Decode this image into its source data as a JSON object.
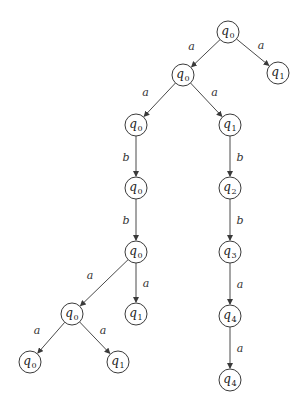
{
  "diagram": {
    "type": "tree",
    "title": "",
    "nodes": [
      {
        "id": "n0",
        "label": "q",
        "sub": "0",
        "x": 228,
        "y": 32
      },
      {
        "id": "n1",
        "label": "q",
        "sub": "0",
        "x": 183,
        "y": 75
      },
      {
        "id": "n2",
        "label": "q",
        "sub": "1",
        "x": 278,
        "y": 73
      },
      {
        "id": "n3",
        "label": "q",
        "sub": "0",
        "x": 136,
        "y": 125
      },
      {
        "id": "n4",
        "label": "q",
        "sub": "1",
        "x": 230,
        "y": 125
      },
      {
        "id": "n5",
        "label": "q",
        "sub": "0",
        "x": 136,
        "y": 188
      },
      {
        "id": "n6",
        "label": "q",
        "sub": "2",
        "x": 230,
        "y": 188
      },
      {
        "id": "n7",
        "label": "q",
        "sub": "0",
        "x": 136,
        "y": 252
      },
      {
        "id": "n8",
        "label": "q",
        "sub": "3",
        "x": 230,
        "y": 252
      },
      {
        "id": "n9",
        "label": "q",
        "sub": "0",
        "x": 72,
        "y": 314
      },
      {
        "id": "n10",
        "label": "q",
        "sub": "1",
        "x": 136,
        "y": 314
      },
      {
        "id": "n11",
        "label": "q",
        "sub": "4",
        "x": 230,
        "y": 316
      },
      {
        "id": "n12",
        "label": "q",
        "sub": "0",
        "x": 30,
        "y": 362
      },
      {
        "id": "n13",
        "label": "q",
        "sub": "1",
        "x": 118,
        "y": 362
      },
      {
        "id": "n14",
        "label": "q",
        "sub": "4",
        "x": 230,
        "y": 380
      }
    ],
    "edges": [
      {
        "from": "n0",
        "to": "n1",
        "label": "a"
      },
      {
        "from": "n0",
        "to": "n2",
        "label": "a"
      },
      {
        "from": "n1",
        "to": "n3",
        "label": "a"
      },
      {
        "from": "n1",
        "to": "n4",
        "label": "a"
      },
      {
        "from": "n3",
        "to": "n5",
        "label": "b"
      },
      {
        "from": "n4",
        "to": "n6",
        "label": "b"
      },
      {
        "from": "n5",
        "to": "n7",
        "label": "b"
      },
      {
        "from": "n6",
        "to": "n8",
        "label": "b"
      },
      {
        "from": "n7",
        "to": "n9",
        "label": "a"
      },
      {
        "from": "n7",
        "to": "n10",
        "label": "a"
      },
      {
        "from": "n8",
        "to": "n11",
        "label": "a"
      },
      {
        "from": "n9",
        "to": "n12",
        "label": "a"
      },
      {
        "from": "n9",
        "to": "n13",
        "label": "a"
      },
      {
        "from": "n11",
        "to": "n14",
        "label": "a"
      }
    ],
    "style": {
      "node_radius": 11,
      "stroke_color": "#3a3a3a",
      "background": "#ffffff"
    }
  }
}
